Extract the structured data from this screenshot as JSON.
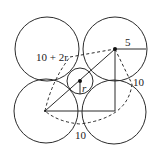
{
  "diagram": {
    "labels": {
      "diagonal": "10 + 2r",
      "radius_big": "5",
      "side_right": "10",
      "radius_small": "r",
      "side_bottom": "10"
    },
    "circles": [
      {
        "name": "top-left",
        "cx": 47,
        "cy": 49,
        "r": 32
      },
      {
        "name": "top-right",
        "cx": 115,
        "cy": 49,
        "r": 32
      },
      {
        "name": "bottom-left",
        "cx": 46,
        "cy": 111,
        "r": 32
      },
      {
        "name": "bottom-right",
        "cx": 114,
        "cy": 112,
        "r": 32
      },
      {
        "name": "center-small",
        "cx": 80,
        "cy": 81,
        "r": 13
      }
    ],
    "colors": {
      "line": "#2b2b2b",
      "background": "#ffffff"
    }
  }
}
